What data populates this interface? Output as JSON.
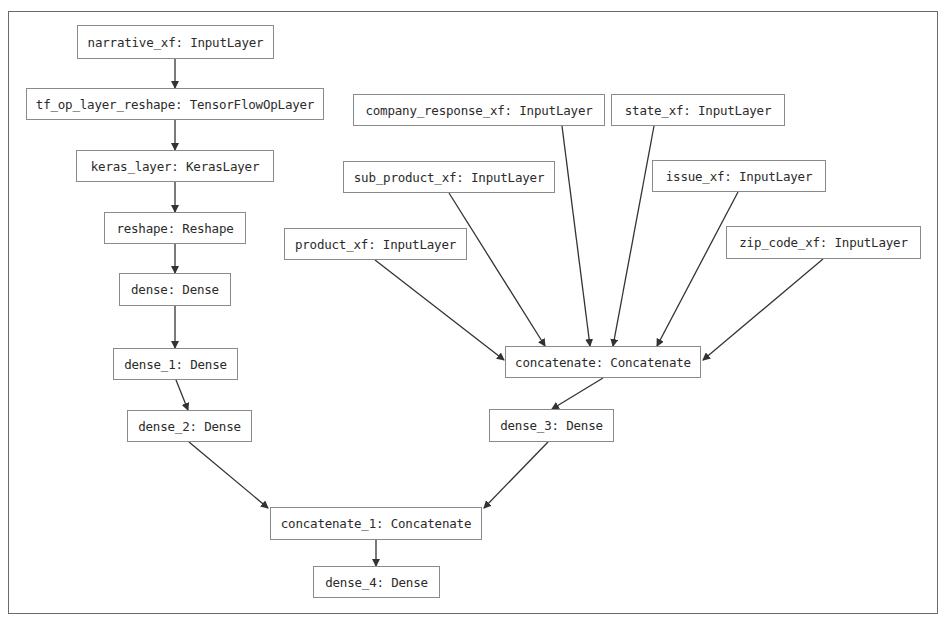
{
  "diagram": {
    "type": "keras-model-graph",
    "colors": {
      "stroke": "#333333",
      "node_border": "#8a8a8a",
      "text": "#2b2b2b",
      "background": "#ffffff"
    },
    "nodes": {
      "narrative_xf": {
        "label": "narrative_xf: InputLayer"
      },
      "tf_op_layer_reshape": {
        "label": "tf_op_layer_reshape: TensorFlowOpLayer"
      },
      "keras_layer": {
        "label": "keras_layer: KerasLayer"
      },
      "reshape": {
        "label": "reshape: Reshape"
      },
      "dense": {
        "label": "dense: Dense"
      },
      "dense_1": {
        "label": "dense_1: Dense"
      },
      "dense_2": {
        "label": "dense_2: Dense"
      },
      "company_response_xf": {
        "label": "company_response_xf: InputLayer"
      },
      "state_xf": {
        "label": "state_xf: InputLayer"
      },
      "sub_product_xf": {
        "label": "sub_product_xf: InputLayer"
      },
      "issue_xf": {
        "label": "issue_xf: InputLayer"
      },
      "product_xf": {
        "label": "product_xf: InputLayer"
      },
      "zip_code_xf": {
        "label": "zip_code_xf: InputLayer"
      },
      "concatenate": {
        "label": "concatenate: Concatenate"
      },
      "dense_3": {
        "label": "dense_3: Dense"
      },
      "concatenate_1": {
        "label": "concatenate_1: Concatenate"
      },
      "dense_4": {
        "label": "dense_4: Dense"
      }
    },
    "edges": [
      [
        "narrative_xf",
        "tf_op_layer_reshape"
      ],
      [
        "tf_op_layer_reshape",
        "keras_layer"
      ],
      [
        "keras_layer",
        "reshape"
      ],
      [
        "reshape",
        "dense"
      ],
      [
        "dense",
        "dense_1"
      ],
      [
        "dense_1",
        "dense_2"
      ],
      [
        "product_xf",
        "concatenate"
      ],
      [
        "sub_product_xf",
        "concatenate"
      ],
      [
        "company_response_xf",
        "concatenate"
      ],
      [
        "state_xf",
        "concatenate"
      ],
      [
        "issue_xf",
        "concatenate"
      ],
      [
        "zip_code_xf",
        "concatenate"
      ],
      [
        "concatenate",
        "dense_3"
      ],
      [
        "dense_2",
        "concatenate_1"
      ],
      [
        "dense_3",
        "concatenate_1"
      ],
      [
        "concatenate_1",
        "dense_4"
      ]
    ]
  }
}
